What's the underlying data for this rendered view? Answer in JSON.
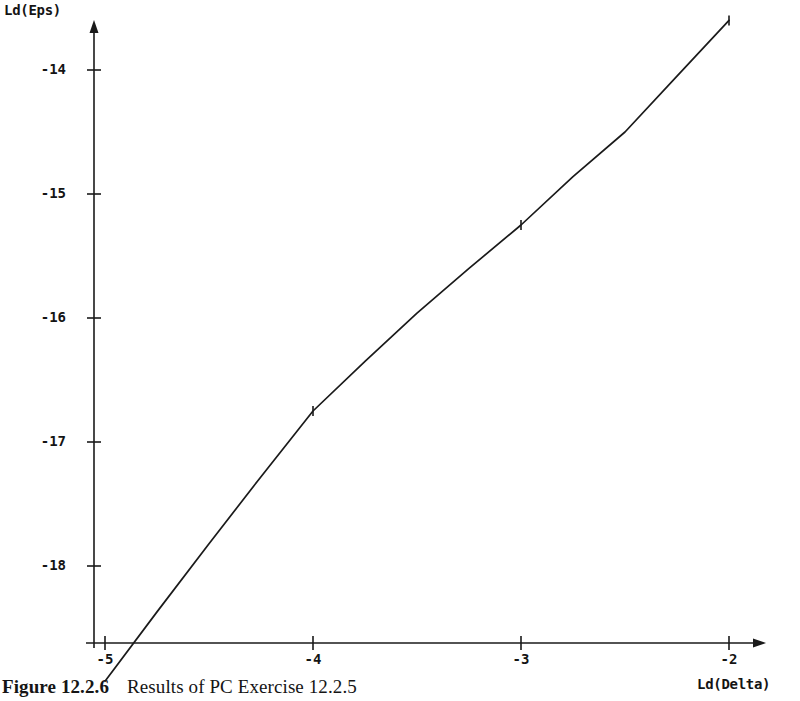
{
  "figure": {
    "caption_label": "Figure 12.2.6",
    "caption_text": "Results of PC Exercise 12.2.5"
  },
  "chart_data": {
    "type": "line",
    "title": "",
    "xlabel": "Ld(Delta)",
    "ylabel": "Ld(Eps)",
    "xlim": [
      -5.0,
      -2.0
    ],
    "ylim": [
      -19.0,
      -13.4
    ],
    "xticks": [
      -5,
      -4,
      -3,
      -2
    ],
    "xticklabels": [
      "-5",
      "-4",
      "-3",
      "-2"
    ],
    "yticks": [
      -14,
      -15,
      -16,
      -17,
      -18
    ],
    "yticklabels": [
      "-14",
      "-15",
      "-16",
      "-17",
      "-18"
    ],
    "grid": false,
    "legend": null,
    "axis_style": "arrow-ended single line axes",
    "line_color": "#1a1a1a",
    "series": [
      {
        "name": "Ld(Eps) vs Ld(Delta)",
        "x": [
          -5.0,
          -4.75,
          -4.5,
          -4.25,
          -4.0,
          -3.75,
          -3.5,
          -3.25,
          -3.0,
          -2.75,
          -2.5,
          -2.25,
          -2.0
        ],
        "y": [
          -18.93,
          -18.37,
          -17.82,
          -17.28,
          -16.75,
          -16.35,
          -15.96,
          -15.6,
          -15.25,
          -14.86,
          -14.5,
          -14.05,
          -13.6
        ],
        "markers_at_x": [
          -4.0,
          -3.0,
          -2.0
        ]
      }
    ]
  }
}
